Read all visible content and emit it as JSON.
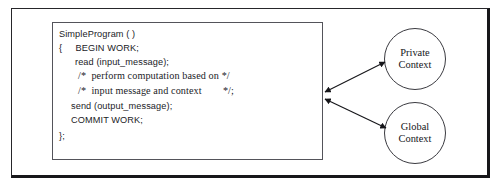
{
  "diagram": {
    "code_box": {
      "lines": [
        {
          "text": "SimpleProgram ( )",
          "style": "sans",
          "x": 6,
          "y": 6
        },
        {
          "text": "{     BEGIN WORK;",
          "style": "sans",
          "x": 6,
          "y": 20
        },
        {
          "text": "read (input_message);",
          "style": "sans",
          "x": 22,
          "y": 34
        },
        {
          "text": "/*  perform computation based on */",
          "style": "serif",
          "x": 25,
          "y": 47
        },
        {
          "text": "/*  input message and context        */;",
          "style": "serif",
          "x": 25,
          "y": 62
        },
        {
          "text": "send (output_message);",
          "style": "sans",
          "x": 18,
          "y": 78
        },
        {
          "text": "COMMIT WORK;",
          "style": "sans",
          "x": 18,
          "y": 92
        },
        {
          "text": "};",
          "style": "sans",
          "x": 6,
          "y": 108
        }
      ]
    },
    "nodes": [
      {
        "name": "private-context",
        "line1": "Private",
        "line2": "Context"
      },
      {
        "name": "global-context",
        "line1": "Global",
        "line2": "Context"
      }
    ],
    "connectors": [
      {
        "name": "program-to-private-context",
        "arrowheads": "both"
      },
      {
        "name": "program-to-global-context",
        "arrowheads": "both"
      }
    ],
    "colors": {
      "ink": "#1b1b1f",
      "frame": "#26262a",
      "box_border": "#53535a",
      "background": "#ffffff"
    }
  }
}
